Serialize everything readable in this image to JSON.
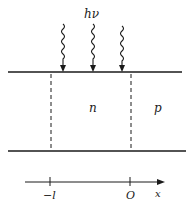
{
  "diagram": {
    "type": "semiconductor-pn-junction-illumination",
    "photon_label": "hν",
    "photon_arrow_count": 3,
    "regions": [
      {
        "label": "n",
        "from": "−l",
        "to": "0"
      },
      {
        "label": "p",
        "from": "0",
        "to": "∞"
      }
    ],
    "axis": {
      "label": "x",
      "ticks": [
        {
          "label": "−l"
        },
        {
          "label": "O"
        }
      ]
    },
    "colors": {
      "ink": "#1a1a1a",
      "background": "#ffffff"
    }
  }
}
